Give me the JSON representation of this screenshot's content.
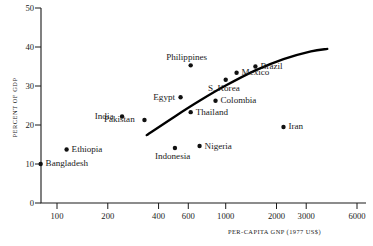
{
  "chart_data": {
    "type": "scatter",
    "title": "",
    "xlabel": "PER-CAPITA GNP (1977 US$)",
    "ylabel": "PERCENT OF GDP",
    "xscale": "log",
    "yscale": "linear",
    "xlim": [
      70,
      6800
    ],
    "ylim": [
      0,
      50
    ],
    "grid": false,
    "legend": "none",
    "xticks": [
      100,
      200,
      400,
      600,
      1000,
      2000,
      3000,
      6000
    ],
    "xtick_labels": [
      "100",
      "200",
      "400",
      "600",
      "1000",
      "2000",
      "3000",
      "6000"
    ],
    "yticks": [
      0,
      10,
      20,
      30,
      40,
      50
    ],
    "ytick_labels": [
      "0",
      "10",
      "20",
      "30",
      "40",
      "50"
    ],
    "points": [
      {
        "name": "Bangladesh",
        "x": 80,
        "y": 10.0,
        "label_pos": "right"
      },
      {
        "name": "Ethiopia",
        "x": 114,
        "y": 13.7,
        "label_pos": "right"
      },
      {
        "name": "India",
        "x": 243,
        "y": 22.2,
        "label_pos": "left"
      },
      {
        "name": "Pakistan",
        "x": 330,
        "y": 21.3,
        "label_pos": "left"
      },
      {
        "name": "Indonesia",
        "x": 500,
        "y": 14.1,
        "label_pos": "below"
      },
      {
        "name": "Egypt",
        "x": 540,
        "y": 27.1,
        "label_pos": "left"
      },
      {
        "name": "Philippines",
        "x": 620,
        "y": 35.3,
        "label_pos": "above"
      },
      {
        "name": "Thailand",
        "x": 620,
        "y": 23.3,
        "label_pos": "right"
      },
      {
        "name": "Nigeria",
        "x": 700,
        "y": 14.6,
        "label_pos": "right"
      },
      {
        "name": "Colombia",
        "x": 870,
        "y": 26.2,
        "label_pos": "right"
      },
      {
        "name": "S. Korea",
        "x": 1000,
        "y": 31.6,
        "label_pos": "below"
      },
      {
        "name": "Mexico",
        "x": 1160,
        "y": 33.4,
        "label_pos": "right"
      },
      {
        "name": "Brazil",
        "x": 1500,
        "y": 35.0,
        "label_pos": "right"
      },
      {
        "name": "Iran",
        "x": 2200,
        "y": 19.5,
        "label_pos": "right"
      }
    ],
    "trend_curve": {
      "description": "fitted increasing concave curve",
      "points": [
        {
          "x": 340,
          "y": 17.4
        },
        {
          "x": 500,
          "y": 22.2
        },
        {
          "x": 700,
          "y": 26.2
        },
        {
          "x": 1000,
          "y": 30.1
        },
        {
          "x": 1500,
          "y": 34.0
        },
        {
          "x": 2200,
          "y": 36.9
        },
        {
          "x": 3200,
          "y": 38.9
        },
        {
          "x": 4000,
          "y": 39.5
        }
      ]
    }
  }
}
